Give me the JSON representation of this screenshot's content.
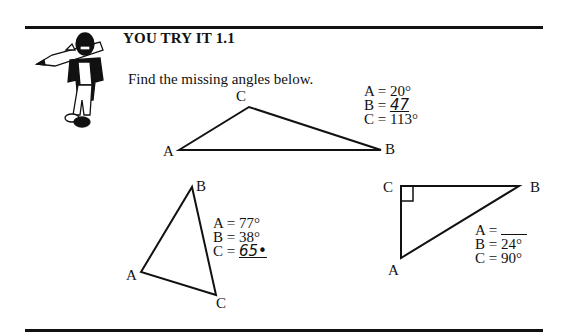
{
  "header": {
    "title": "YOU TRY IT 1.1",
    "instruction": "Find the missing angles below.",
    "mascot_icon": "pencil-carrying-character-icon"
  },
  "triangles": [
    {
      "id": "obtuse",
      "vertices": {
        "A": "A",
        "B": "B",
        "C": "C"
      },
      "angles": {
        "A": {
          "label": "A = ",
          "value": "20°"
        },
        "B": {
          "label": "B = ",
          "value": "47",
          "handwritten": true
        },
        "C": {
          "label": "C = ",
          "value": "113°"
        }
      }
    },
    {
      "id": "acute",
      "vertices": {
        "A": "A",
        "B": "B",
        "C": "C"
      },
      "angles": {
        "A": {
          "label": "A = ",
          "value": "77°"
        },
        "B": {
          "label": "B = ",
          "value": "38°"
        },
        "C": {
          "label": "C = ",
          "value": "65•",
          "handwritten": true
        }
      }
    },
    {
      "id": "right",
      "vertices": {
        "A": "A",
        "B": "B",
        "C": "C"
      },
      "angles": {
        "A": {
          "label": "A = ",
          "value": ""
        },
        "B": {
          "label": "B = ",
          "value": "24°"
        },
        "C": {
          "label": "C = ",
          "value": "90°"
        }
      }
    }
  ]
}
